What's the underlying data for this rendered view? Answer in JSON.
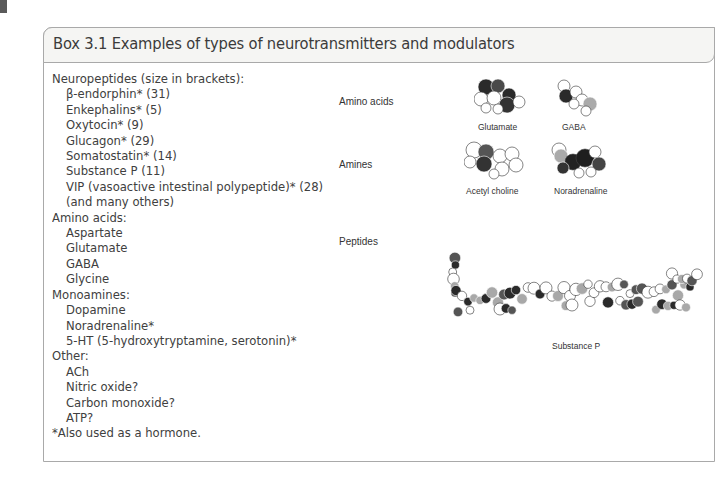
{
  "box": {
    "title": "Box 3.1 Examples of types of neurotransmitters and modulators",
    "list": [
      {
        "type": "cat",
        "text": "Neuropeptides (size in brackets):"
      },
      {
        "type": "item",
        "text": "β-endorphin* (31)"
      },
      {
        "type": "item",
        "text": "Enkephalins* (5)"
      },
      {
        "type": "item",
        "text": "Oxytocin* (9)"
      },
      {
        "type": "item",
        "text": "Glucagon* (29)"
      },
      {
        "type": "item",
        "text": "Somatostatin* (14)"
      },
      {
        "type": "item",
        "text": "Substance P (11)"
      },
      {
        "type": "item",
        "text": "VIP (vasoactive intestinal polypeptide)* (28)"
      },
      {
        "type": "item",
        "text": "(and many others)"
      },
      {
        "type": "cat",
        "text": "Amino acids:"
      },
      {
        "type": "item",
        "text": "Aspartate"
      },
      {
        "type": "item",
        "text": "Glutamate"
      },
      {
        "type": "item",
        "text": "GABA"
      },
      {
        "type": "item",
        "text": "Glycine"
      },
      {
        "type": "cat",
        "text": "Monoamines:"
      },
      {
        "type": "item",
        "text": "Dopamine"
      },
      {
        "type": "item",
        "text": "Noradrenaline*"
      },
      {
        "type": "item",
        "text": "5-HT (5-hydroxytryptamine, serotonin)*"
      },
      {
        "type": "cat",
        "text": "Other:"
      },
      {
        "type": "item",
        "text": "ACh"
      },
      {
        "type": "item",
        "text": "Nitric oxide?"
      },
      {
        "type": "item",
        "text": "Carbon monoxide?"
      },
      {
        "type": "item",
        "text": "ATP?"
      },
      {
        "type": "note",
        "text": "*Also used as a hormone."
      }
    ]
  },
  "figure": {
    "row_labels": {
      "amino_acids": "Amino acids",
      "amines": "Amines",
      "peptides": "Peptides"
    },
    "molecules": {
      "glutamate": "Glutamate",
      "gaba": "GABA",
      "acetylcholine": "Acetyl choline",
      "noradrenaline": "Noradrenaline",
      "substance_p": "Substance P"
    },
    "atom_colors": {
      "carbon": "#2a2a2a",
      "oxygen": "#555555",
      "nitrogen": "#a8a8a8",
      "hydrogen": "#ffffff"
    }
  }
}
